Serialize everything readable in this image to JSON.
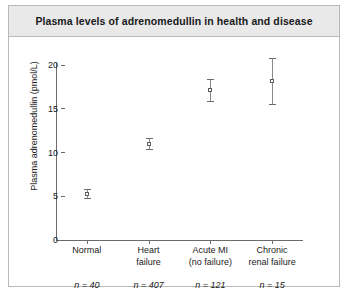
{
  "chart_data": {
    "type": "scatter",
    "title": "Plasma levels of adrenomedullin in health and disease",
    "xlabel": "",
    "ylabel": "Plasma adrenomedullin (pmol/L)",
    "ylim": [
      0,
      20
    ],
    "yticks": [
      0,
      5,
      10,
      15,
      20
    ],
    "ytick_labels": [
      "0",
      "5",
      "10",
      "15",
      "20"
    ],
    "grid": false,
    "legend": "none",
    "categories": [
      "Normal",
      "Heart failure",
      "Acute MI (no failure)",
      "Chronic renal failure"
    ],
    "category_lines": [
      [
        "Normal"
      ],
      [
        "Heart",
        "failure"
      ],
      [
        "Acute MI",
        "(no failure)"
      ],
      [
        "Chronic",
        "renal failure"
      ]
    ],
    "values": [
      5.3,
      11.0,
      17.2,
      18.2
    ],
    "error_low": [
      4.8,
      10.4,
      15.9,
      15.6
    ],
    "error_high": [
      5.8,
      11.7,
      18.4,
      20.8
    ],
    "sample_sizes": [
      "n = 40",
      "n = 407",
      "n = 121",
      "n = 15"
    ],
    "marker_color": "#5d5d5d",
    "axis_color": "#6b6b6b"
  },
  "figure": {
    "title_band_color": "#e9e9e9",
    "border_color": "#b9b9b9",
    "background": "#ffffff"
  }
}
